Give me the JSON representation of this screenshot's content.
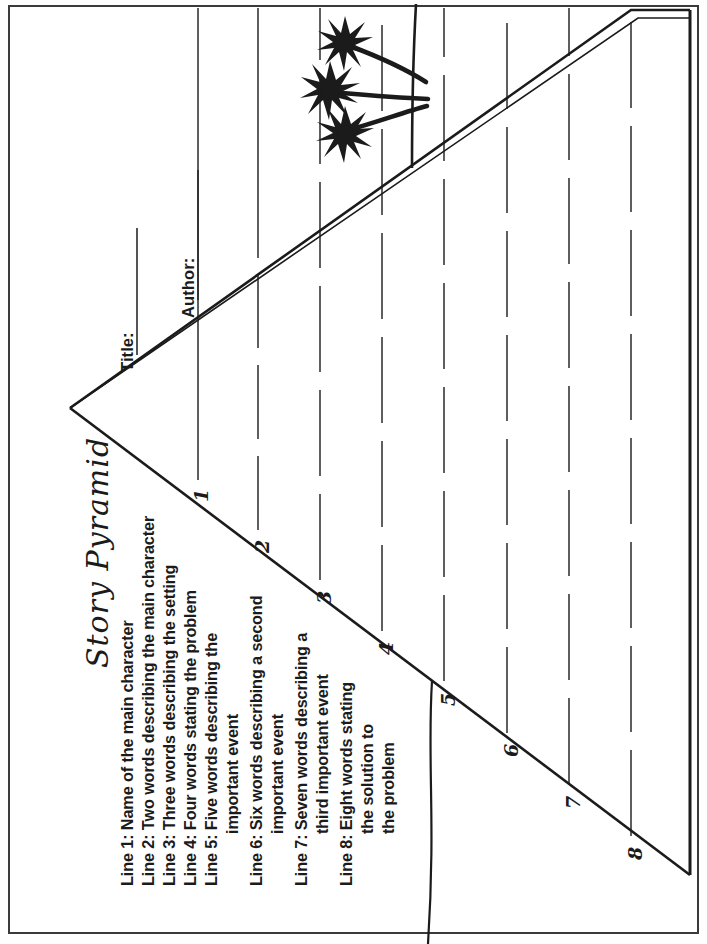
{
  "document": {
    "kind": "worksheet",
    "title": "Story Pyramid",
    "orientation": "content rotated 90 degrees counter-clockwise on page",
    "ink_color": "#1b1b1b",
    "paper_color": "#ffffff",
    "border_color": "#3a3a3a"
  },
  "fields": [
    {
      "label": "Title:",
      "value": ""
    },
    {
      "label": "Author:",
      "value": ""
    }
  ],
  "instructions": [
    {
      "text": "Line 1: Name of the main character",
      "continuation": []
    },
    {
      "text": "Line 2: Two words describing the main character",
      "continuation": []
    },
    {
      "text": "Line 3: Three words describing the setting",
      "continuation": []
    },
    {
      "text": "Line 4: Four words stating the problem",
      "continuation": []
    },
    {
      "text": "Line 5: Five words describing the",
      "continuation": [
        "important event"
      ]
    },
    {
      "text": "Line 6: Six words describing a second",
      "continuation": [
        "important event"
      ]
    },
    {
      "text": "Line 7: Seven words describing a",
      "continuation": [
        "third important event"
      ]
    },
    {
      "text": "Line 8: Eight words stating",
      "continuation": [
        "the solution to",
        "the problem"
      ]
    }
  ],
  "pyramid": {
    "row_numbers": [
      "1",
      "2",
      "3",
      "4",
      "5",
      "6",
      "7",
      "8"
    ],
    "rows": 8,
    "description": "right triangle with 8 dashed writing rows"
  },
  "decoration": {
    "palm_trees": 3,
    "shoreline": 1
  },
  "icons": {
    "palm": "palm-tree-icon",
    "shore": "shoreline-icon"
  }
}
